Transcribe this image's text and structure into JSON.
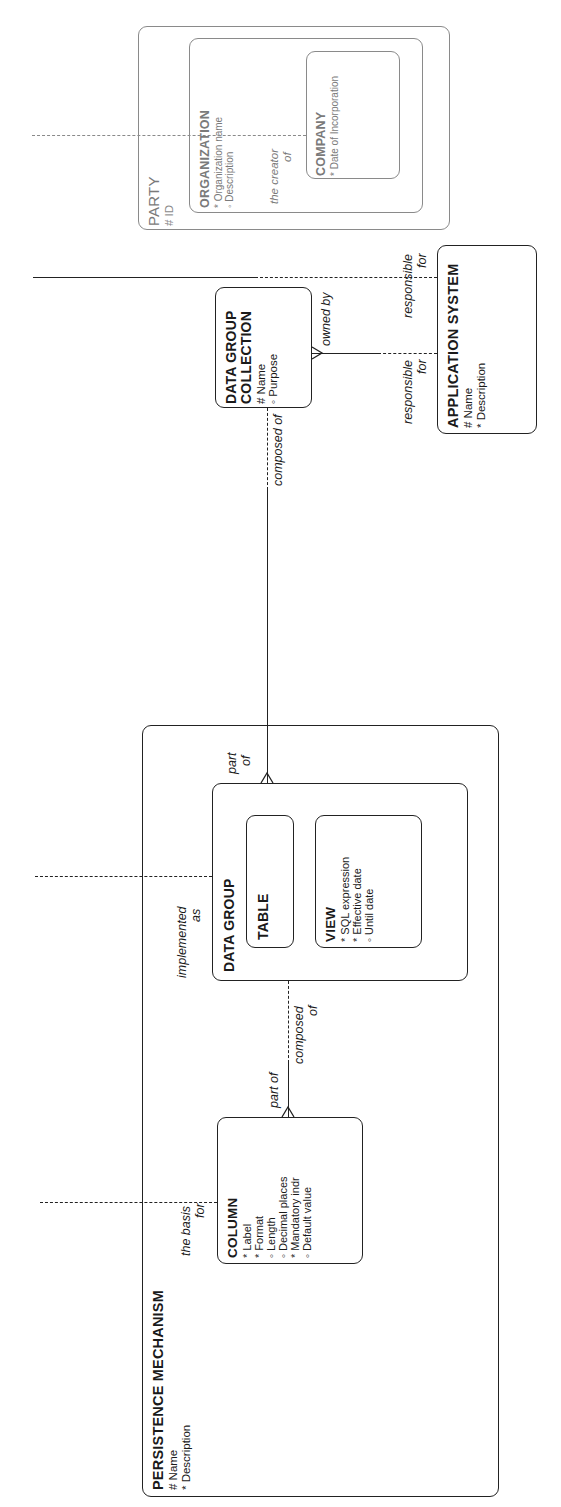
{
  "diagram": {
    "orientation": "rotated -90deg (text reads bottom-to-top)",
    "entities": {
      "party": {
        "name": "PARTY",
        "attributes": [
          "# ID"
        ],
        "style": "greyed"
      },
      "organization": {
        "name": "ORGANIZATION",
        "attributes": [
          "* Organization name",
          "◦ Description"
        ],
        "style": "greyed"
      },
      "company": {
        "name": "COMPANY",
        "attributes": [
          "* Date of Incorporation"
        ],
        "style": "greyed"
      },
      "application_system": {
        "name": "APPLICATION SYSTEM",
        "attributes": [
          "# Name",
          "* Description"
        ]
      },
      "data_group_collection": {
        "name_line1": "DATA GROUP",
        "name_line2": "COLLECTION",
        "attributes": [
          "# Name",
          "◦ Purpose"
        ]
      },
      "persistence_mechanism": {
        "name": "PERSISTENCE MECHANISM",
        "attributes": [
          "# Name",
          "* Description"
        ]
      },
      "data_group": {
        "name": "DATA GROUP"
      },
      "table": {
        "name": "TABLE"
      },
      "view": {
        "name": "VIEW",
        "attributes": [
          "* SQL expression",
          "* Effective date",
          "◦ Until date"
        ]
      },
      "column": {
        "name": "COLUMN",
        "attributes": [
          "* Label",
          "* Format",
          "◦ Length",
          "◦ Decimal places",
          "* Mandatory indr",
          "◦ Default value"
        ]
      }
    },
    "relationship_labels": {
      "creator_of_line1": "the creator",
      "creator_of_line2": "of",
      "responsible_for_a_line1": "responsible",
      "responsible_for_a_line2": "for",
      "responsible_for_b_line1": "responsible",
      "responsible_for_b_line2": "for",
      "owned_by": "owned by",
      "composed_of_dgc": "composed of",
      "part_of_dg_line1": "part",
      "part_of_dg_line2": "of",
      "implemented_as_line1": "implemented",
      "implemented_as_line2": "as",
      "composed_of_dg_line1": "composed",
      "composed_of_dg_line2": "of",
      "part_of_col": "part of",
      "basis_for_line1": "the basis",
      "basis_for_line2": "for"
    }
  }
}
